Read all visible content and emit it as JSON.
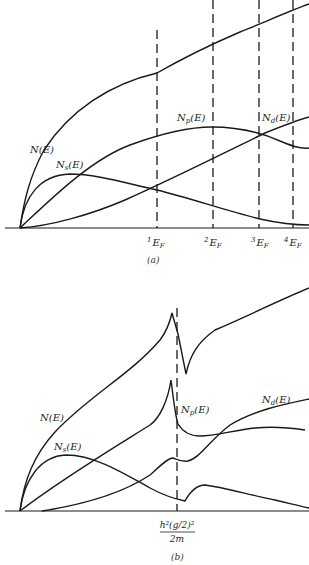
{
  "panel_a": {
    "caption": "(a)",
    "labels": {
      "N": "N(E)",
      "Ns_main": "N",
      "Ns_sub": "s",
      "Ns_tail": "(E)",
      "Np_main": "N",
      "Np_sub": "p",
      "Np_tail": "(E)",
      "Nd_main": "N",
      "Nd_sub": "d",
      "Nd_tail": "(E)"
    },
    "fermi_levels": [
      {
        "sup": "1",
        "main": "E",
        "sub": "F"
      },
      {
        "sup": "2",
        "main": "E",
        "sub": "F"
      },
      {
        "sup": "3",
        "main": "E",
        "sub": "F"
      },
      {
        "sup": "4",
        "main": "E",
        "sub": "F"
      }
    ]
  },
  "panel_b": {
    "caption": "(b)",
    "labels": {
      "N": "N(E)",
      "Ns_main": "N",
      "Ns_sub": "s",
      "Ns_tail": "(E)",
      "Np_main": "N",
      "Np_sub": "p",
      "Np_tail": "(E)",
      "Nd_main": "N",
      "Nd_sub": "d",
      "Nd_tail": "(E)"
    },
    "gap_label": {
      "numerator": "h²(g/2)²",
      "denominator": "2m"
    }
  }
}
